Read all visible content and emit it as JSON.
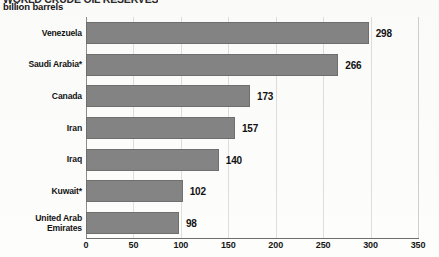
{
  "chart_data": {
    "type": "bar",
    "orientation": "horizontal",
    "title": "billion barrels",
    "subtitle": "billion barrels",
    "clipped_title_fragment": "WORLD CRUDE OIL RESERVES",
    "xlabel": "",
    "ylabel": "",
    "categories": [
      "Venezuela",
      "Saudi Arabia*",
      "Canada",
      "Iran",
      "Iraq",
      "Kuwait*",
      "United Arab\nEmirates"
    ],
    "values": [
      298,
      266,
      173,
      157,
      140,
      102,
      98
    ],
    "value_labels": [
      "298",
      "266",
      "173",
      "157",
      "140",
      "102",
      "98"
    ],
    "xlim": [
      0,
      350
    ],
    "xticks": [
      0,
      50,
      100,
      150,
      200,
      250,
      300,
      350
    ],
    "xtick_labels": [
      "0",
      "50",
      "100",
      "150",
      "200",
      "250",
      "300",
      "350"
    ],
    "grid": true,
    "grid_axis": "x",
    "legend": false,
    "bar_color": "#848484",
    "bar_edge_color": "#6f6f6f",
    "grid_color": "#dededc",
    "axis_color": "#6e6e6e",
    "background_color": "#fdfdfc",
    "text_color": "#131313"
  }
}
